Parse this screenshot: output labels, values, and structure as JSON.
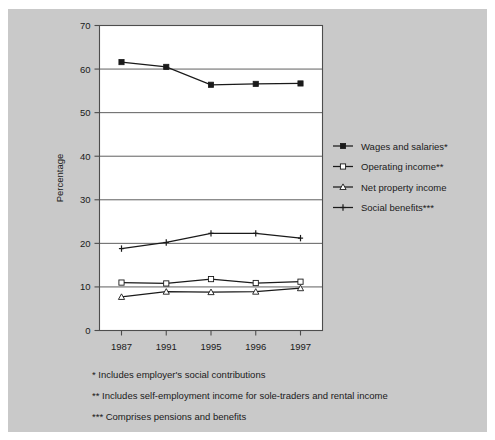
{
  "chart_data": {
    "type": "line",
    "title": "",
    "xlabel": "",
    "ylabel": "Percentage",
    "categories": [
      "1987",
      "1991",
      "1995",
      "1996",
      "1997"
    ],
    "ylim": [
      0,
      70
    ],
    "ytick_step": 10,
    "yticks": [
      "0",
      "10",
      "20",
      "30",
      "40",
      "50",
      "60",
      "70"
    ],
    "grid": "horizontal",
    "legend_position": "right",
    "series": [
      {
        "name": "Wages and salaries*",
        "marker": "filled-square",
        "values": [
          61.6,
          60.5,
          56.4,
          56.6,
          56.7
        ]
      },
      {
        "name": "Operating income**",
        "marker": "open-square",
        "values": [
          11.0,
          10.8,
          11.8,
          10.9,
          11.2
        ]
      },
      {
        "name": "Net property income",
        "marker": "open-triangle",
        "values": [
          7.7,
          8.9,
          8.8,
          8.9,
          9.7
        ]
      },
      {
        "name": "Social benefits***",
        "marker": "cross",
        "values": [
          18.8,
          20.2,
          22.3,
          22.3,
          21.2
        ]
      }
    ]
  },
  "axis": {
    "y_title": "Percentage"
  },
  "footnotes": [
    "* Includes employer's social contributions",
    "** Includes self-employment income for sole-traders and rental income",
    "*** Comprises pensions and benefits"
  ],
  "colors": {
    "panel_background": "#c9c9c9",
    "plot_background": "#ffffff",
    "line": "#1a1a1a",
    "gridline": "#4d4d4d",
    "text": "#1a1a1a"
  }
}
